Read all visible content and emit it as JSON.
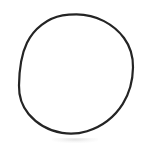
{
  "image": {
    "kind": "scanned-line-drawing",
    "width": 142,
    "height": 158,
    "background_color": "#ffffff",
    "has_text": false,
    "caption": ""
  },
  "shapes": [
    {
      "name": "circle-outline",
      "type": "circle",
      "center_x": 76,
      "center_y": 74,
      "radius_x": 57,
      "radius_y": 60,
      "stroke_color": "#242424",
      "stroke_width": 2.2,
      "fill": "none",
      "bounds": {
        "left": 19,
        "top": 14,
        "right": 133,
        "bottom": 134
      },
      "appearance": "hand-drawn, slightly irregular, photocopied"
    }
  ],
  "artifacts": [
    {
      "name": "scan-smudge",
      "color": "#9a9a9a",
      "opacity": 0.2,
      "x": 52,
      "y": 138,
      "width": 46,
      "height": 5
    }
  ]
}
